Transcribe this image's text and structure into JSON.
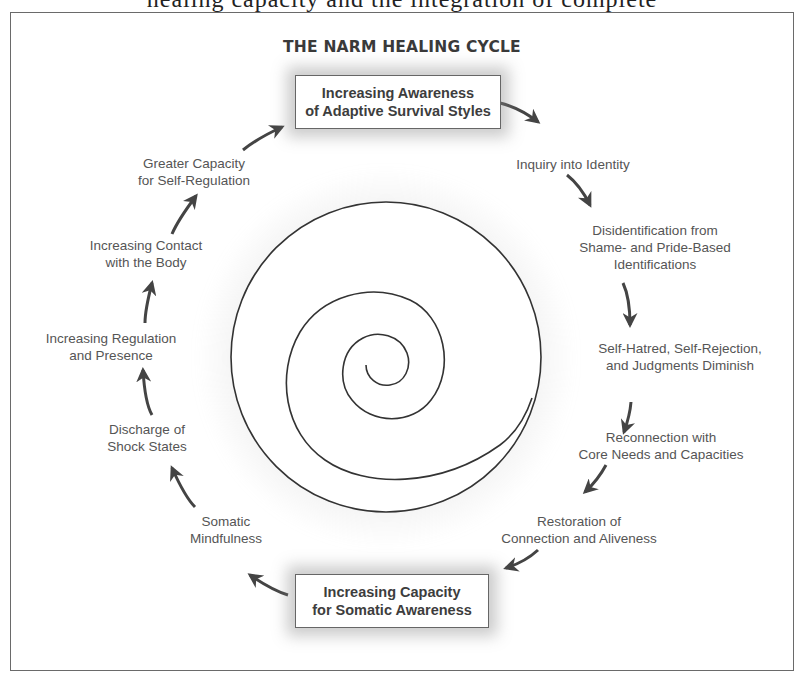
{
  "page_header_clipped": "healing capacity and the integration of complete",
  "diagram": {
    "title": "THE NARM HEALING CYCLE",
    "top_box": {
      "line1": "Increasing Awareness",
      "line2": "of Adaptive Survival Styles"
    },
    "bottom_box": {
      "line1": "Increasing Capacity",
      "line2": "for Somatic Awareness"
    },
    "right_side_steps": [
      {
        "line1": "Inquiry into Identity",
        "line2": "",
        "line3": ""
      },
      {
        "line1": "Disidentification from",
        "line2": "Shame- and Pride-Based",
        "line3": "Identifications"
      },
      {
        "line1": "Self-Hatred, Self-Rejection,",
        "line2": "and Judgments Diminish",
        "line3": ""
      },
      {
        "line1": "Reconnection with",
        "line2": "Core Needs and Capacities",
        "line3": ""
      },
      {
        "line1": "Restoration of",
        "line2": "Connection and Aliveness",
        "line3": ""
      }
    ],
    "left_side_steps": [
      {
        "line1": "Somatic",
        "line2": "Mindfulness"
      },
      {
        "line1": "Discharge of",
        "line2": "Shock States"
      },
      {
        "line1": "Increasing Regulation",
        "line2": "and Presence"
      },
      {
        "line1": "Increasing Contact",
        "line2": "with the Body"
      },
      {
        "line1": "Greater Capacity",
        "line2": "for Self-Regulation"
      }
    ],
    "center_graphic": "spiral-in-circle",
    "flow_direction": "clockwise",
    "colors": {
      "text": "#555555",
      "box_border": "#666666",
      "arrow": "#444444",
      "frame": "#6a6a6a"
    }
  }
}
